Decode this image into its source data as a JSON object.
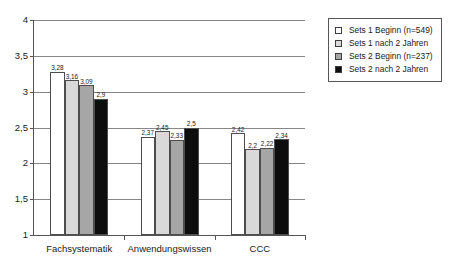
{
  "chart_data": {
    "type": "bar",
    "title": "",
    "subtitle": "",
    "xlabel": "",
    "ylabel": "",
    "categories": [
      "Fachsystematik",
      "Anwendungswissen",
      "CCC"
    ],
    "series": [
      {
        "name": "Sets 1 Beginn (n=549)",
        "color": "#ffffff",
        "values": [
          3.28,
          2.37,
          2.42
        ],
        "labels": [
          "3,28",
          "2,37",
          "2,42"
        ]
      },
      {
        "name": "Sets 1 nach 2 Jahren",
        "color": "#d9d9d9",
        "values": [
          3.16,
          2.45,
          2.2
        ],
        "labels": [
          "3,16",
          "2,45",
          "2,2"
        ]
      },
      {
        "name": "Sets 2 Beginn (n=237)",
        "color": "#a6a6a6",
        "values": [
          3.09,
          2.33,
          2.22
        ],
        "labels": [
          "3,09",
          "2,33",
          "2,22"
        ]
      },
      {
        "name": "Sets 2 nach 2 Jahren",
        "color": "#0d0d0d",
        "values": [
          2.9,
          2.5,
          2.34
        ],
        "labels": [
          "2,9",
          "2,5",
          "2,34"
        ]
      }
    ],
    "ylim": [
      1,
      4
    ],
    "yticks": [
      1,
      1.5,
      2,
      2.5,
      3,
      3.5,
      4
    ],
    "ytick_labels": [
      "1",
      "1,5",
      "2",
      "2,5",
      "3",
      "3,5",
      "4"
    ],
    "grid": true,
    "grid_axis": "y",
    "legend_position": "upper right",
    "legend_entries": [
      "Sets 1 Beginn (n=549)",
      "Sets 1 nach 2 Jahren",
      "Sets 2 Beginn (n=237)",
      "Sets 2 nach 2 Jahren"
    ]
  }
}
